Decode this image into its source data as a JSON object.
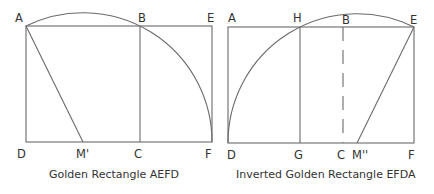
{
  "figures": [
    {
      "caption": "Golden Rectangle AEFD",
      "labels": {
        "A": "A",
        "B": "B",
        "E": "E",
        "D": "D",
        "M": "M'",
        "C": "C",
        "F": "F"
      }
    },
    {
      "caption": "Inverted Golden Rectangle EFDA",
      "labels": {
        "A": "A",
        "H": "H",
        "B": "B",
        "E": "E",
        "D": "D",
        "G": "G",
        "C": "C",
        "M": "M''",
        "F": "F"
      }
    }
  ],
  "colors": {
    "line": "#6a6a6a",
    "text": "#333333"
  }
}
